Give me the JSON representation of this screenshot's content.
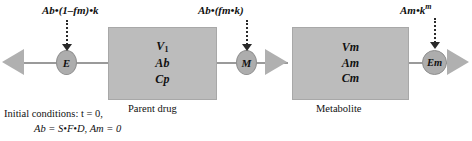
{
  "diagram": {
    "colors": {
      "box_fill": "#bcbcbc",
      "node_fill": "#adadad",
      "arrow_gray": "#b0b0b0",
      "line_gray": "#9a9a9a",
      "dotted_black": "#2a2a2a",
      "text": "#111111",
      "background": "#ffffff"
    }
  },
  "compartments": [
    {
      "id": "parent",
      "caption": "Parent drug",
      "lines": [
        "V",
        "Ab",
        "Cp"
      ],
      "volume_symbol": "V",
      "volume_subscript": "1",
      "amount_symbol": "Ab",
      "concentration_symbol": "Cp"
    },
    {
      "id": "metabolite",
      "caption": "Metabolite",
      "lines": [
        "Vm",
        "Am",
        "Cm"
      ],
      "volume_symbol": "Vm",
      "amount_symbol": "Am",
      "concentration_symbol": "Cm"
    }
  ],
  "nodes": [
    {
      "id": "e",
      "label": "E",
      "meaning": "elimination of parent drug"
    },
    {
      "id": "m",
      "label": "M",
      "meaning": "metabolite formation"
    },
    {
      "id": "em",
      "label": "Em",
      "meaning": "elimination of metabolite"
    }
  ],
  "fluxes": [
    {
      "id": "elimination",
      "base": "Ab•(1–fm)•k",
      "superscript": "",
      "target_node": "E"
    },
    {
      "id": "metabolite_formation",
      "base": "Ab•(fm•k)",
      "superscript": "",
      "target_node": "M"
    },
    {
      "id": "metabolite_elimination",
      "base": "Am•k",
      "superscript": "m",
      "target_node": "Em"
    }
  ],
  "initial_conditions": {
    "line1": "Initial conditions: t = 0,",
    "line2": "Ab = S•F•D, Am = 0"
  }
}
